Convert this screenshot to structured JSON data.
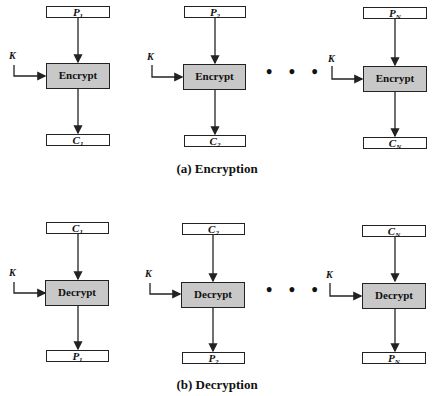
{
  "encryption": {
    "caption": "(a) Encryption",
    "key_label": "K",
    "stages": [
      {
        "input": "P",
        "input_sub": "1",
        "op": "Encrypt",
        "output": "C",
        "output_sub": "1"
      },
      {
        "input": "P",
        "input_sub": "2",
        "op": "Encrypt",
        "output": "C",
        "output_sub": "2"
      },
      {
        "input": "P",
        "input_sub": "N",
        "op": "Encrypt",
        "output": "C",
        "output_sub": "N"
      }
    ],
    "ellipsis": "• • •"
  },
  "decryption": {
    "caption": "(b) Decryption",
    "key_label": "K",
    "stages": [
      {
        "input": "C",
        "input_sub": "1",
        "op": "Decrypt",
        "output": "P",
        "output_sub": "1"
      },
      {
        "input": "C",
        "input_sub": "2",
        "op": "Decrypt",
        "output": "P",
        "output_sub": "2"
      },
      {
        "input": "C",
        "input_sub": "N",
        "op": "Decrypt",
        "output": "P",
        "output_sub": "N"
      }
    ],
    "ellipsis": "• • •"
  },
  "colors": {
    "op_fill": "#c8c8c8",
    "stroke": "#222222"
  }
}
